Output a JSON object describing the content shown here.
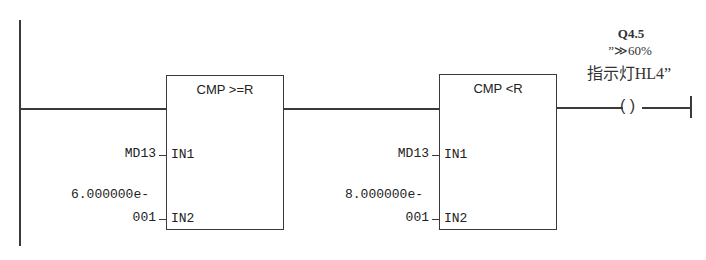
{
  "network": {
    "blocks": [
      {
        "title": "CMP >=R",
        "in1_pin": "IN1",
        "in2_pin": "IN2",
        "in1_operand": "MD13",
        "in2_operand_line1": "6.000000e-",
        "in2_operand_line2": "001"
      },
      {
        "title": "CMP <R",
        "in1_pin": "IN1",
        "in2_pin": "IN2",
        "in1_operand": "MD13",
        "in2_operand_line1": "8.000000e-",
        "in2_operand_line2": "001"
      }
    ],
    "coil": {
      "address": "Q4.5",
      "symbol_line1": "”≫60%",
      "symbol_line2": "指示灯HL4”",
      "glyph": "( )"
    }
  }
}
